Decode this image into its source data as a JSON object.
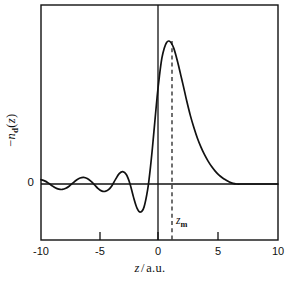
{
  "chart_data": {
    "type": "line",
    "title": "",
    "subtitle": "",
    "xlabel": "z/a.u.",
    "ylabel": "-n_d(z)",
    "xlim": [
      -10,
      10
    ],
    "ylim": [
      -0.3,
      1.05
    ],
    "grid": false,
    "legend": null,
    "xticks": [
      -10,
      -5,
      0,
      5,
      10
    ],
    "xticklabels": [
      "-10",
      "-5",
      "0",
      "5",
      "10"
    ],
    "yticks": [
      0
    ],
    "yticklabels": [
      "0"
    ],
    "annotations": [
      {
        "name": "zm-marker",
        "label": "z_m",
        "x": 1.1,
        "style": "dashed-vertical-line",
        "from_y": 1.0,
        "to_y": -0.3
      },
      {
        "name": "zero-axis-vertical",
        "x": 0,
        "style": "solid-vertical-line"
      },
      {
        "name": "zero-axis-horizontal",
        "y": 0,
        "style": "solid-horizontal-line"
      }
    ],
    "series": [
      {
        "name": "-n_d(z)",
        "color": "#000000",
        "x": [
          -10.0,
          -9.7,
          -9.4,
          -9.1,
          -8.8,
          -8.5,
          -8.2,
          -7.9,
          -7.6,
          -7.3,
          -7.0,
          -6.7,
          -6.4,
          -6.1,
          -5.8,
          -5.5,
          -5.2,
          -4.9,
          -4.6,
          -4.3,
          -4.0,
          -3.7,
          -3.4,
          -3.1,
          -2.8,
          -2.5,
          -2.2,
          -1.9,
          -1.6,
          -1.3,
          -1.0,
          -0.8,
          -0.6,
          -0.4,
          -0.2,
          0.0,
          0.2,
          0.4,
          0.6,
          0.8,
          1.0,
          1.2,
          1.4,
          1.6,
          1.8,
          2.0,
          2.3,
          2.6,
          2.9,
          3.2,
          3.5,
          3.8,
          4.1,
          4.4,
          4.7,
          5.0,
          5.3,
          5.6,
          5.9,
          6.2,
          6.5,
          7.0,
          7.5,
          8.0,
          8.5,
          9.0,
          9.5,
          10.0
        ],
        "y": [
          0.03,
          0.022,
          0.008,
          -0.01,
          -0.026,
          -0.036,
          -0.038,
          -0.03,
          -0.014,
          0.008,
          0.028,
          0.042,
          0.046,
          0.038,
          0.02,
          -0.004,
          -0.03,
          -0.048,
          -0.052,
          -0.04,
          -0.01,
          0.034,
          0.072,
          0.086,
          0.066,
          0.004,
          -0.09,
          -0.168,
          -0.196,
          -0.16,
          -0.04,
          0.09,
          0.25,
          0.43,
          0.61,
          0.76,
          0.88,
          0.95,
          0.99,
          1.0,
          0.985,
          0.95,
          0.895,
          0.83,
          0.76,
          0.69,
          0.58,
          0.48,
          0.395,
          0.32,
          0.258,
          0.205,
          0.16,
          0.122,
          0.09,
          0.064,
          0.044,
          0.028,
          0.014,
          0.004,
          0.0,
          0.0,
          0.0,
          0.0,
          0.0,
          0.0,
          0.0,
          0.0
        ]
      }
    ]
  },
  "figure": {
    "frame": {
      "name": "plot-frame"
    },
    "background_color": "#ffffff",
    "line_color": "#000000"
  }
}
